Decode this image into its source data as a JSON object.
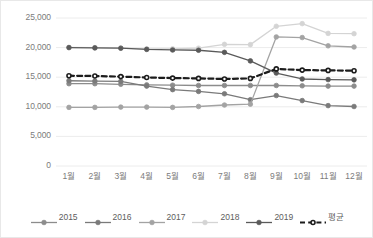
{
  "chart_data": {
    "type": "line",
    "title": "",
    "xlabel": "",
    "ylabel": "",
    "ylim": [
      0,
      25000
    ],
    "yticks": [
      "0",
      "5,000",
      "10,000",
      "15,000",
      "20,000",
      "25,000"
    ],
    "ytick_values": [
      0,
      5000,
      10000,
      15000,
      20000,
      25000
    ],
    "grid": true,
    "legend_position": "bottom",
    "categories": [
      "1월",
      "2월",
      "3월",
      "4월",
      "5월",
      "6월",
      "7월",
      "8월",
      "9월",
      "10월",
      "11월",
      "12월"
    ],
    "series": [
      {
        "name": "2015",
        "color": "#8c8c8c",
        "dashed": false,
        "values": [
          13900,
          13900,
          13800,
          13700,
          13650,
          13600,
          13600,
          13600,
          13600,
          13550,
          13500,
          13500
        ]
      },
      {
        "name": "2016",
        "color": "#7a7a7a",
        "dashed": false,
        "values": [
          14400,
          14350,
          14300,
          13500,
          12900,
          12600,
          12200,
          11200,
          11900,
          11050,
          10200,
          10050
        ]
      },
      {
        "name": "2017",
        "color": "#a3a3a3",
        "dashed": false,
        "values": [
          9900,
          9900,
          9950,
          9950,
          9900,
          10050,
          10300,
          10450,
          21800,
          21700,
          20300,
          20100
        ]
      },
      {
        "name": "2018",
        "color": "#d4d4d4",
        "dashed": false,
        "values": [
          20050,
          20000,
          19900,
          19800,
          19800,
          19900,
          20550,
          20500,
          23600,
          24050,
          22400,
          22350
        ]
      },
      {
        "name": "2019",
        "color": "#5a5a5a",
        "dashed": false,
        "values": [
          20000,
          19950,
          19900,
          19700,
          19600,
          19550,
          19200,
          17750,
          15700,
          14700,
          14600,
          14550
        ]
      },
      {
        "name": "평균",
        "color": "#1c1c1c",
        "dashed": true,
        "values": [
          15250,
          15200,
          15100,
          14950,
          14850,
          14800,
          14700,
          14800,
          16400,
          16200,
          16150,
          16100
        ]
      }
    ]
  },
  "axis": {
    "y_tick_labels": [
      "25,000",
      "20,000",
      "15,000",
      "10,000",
      "5,000",
      "0"
    ],
    "x_tick_labels": [
      "1월",
      "2월",
      "3월",
      "4월",
      "5월",
      "6월",
      "7월",
      "8월",
      "9월",
      "10월",
      "11월",
      "12월"
    ]
  },
  "legend": {
    "items": [
      {
        "label": "2015",
        "color": "#8c8c8c",
        "dashed": false
      },
      {
        "label": "2016",
        "color": "#7a7a7a",
        "dashed": false
      },
      {
        "label": "2017",
        "color": "#a3a3a3",
        "dashed": false
      },
      {
        "label": "2018",
        "color": "#d4d4d4",
        "dashed": false
      },
      {
        "label": "2019",
        "color": "#5a5a5a",
        "dashed": false
      },
      {
        "label": "평균",
        "color": "#1c1c1c",
        "dashed": true
      }
    ]
  },
  "style": {
    "grid_color": "#ececec",
    "axis_text_color": "#7b7b7b",
    "background": "#ffffff",
    "border_color": "#e8e8e8"
  }
}
